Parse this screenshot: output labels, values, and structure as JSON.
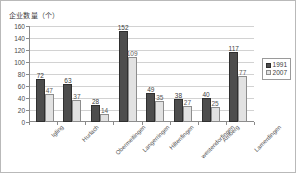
{
  "chart_data": {
    "type": "bar",
    "title": "",
    "ylabel": "企业数量（个）",
    "xlabel": "",
    "ylim": [
      0,
      160
    ],
    "ytick_values": [
      0,
      20,
      40,
      60,
      80,
      100,
      120,
      140,
      160
    ],
    "grid": true,
    "legend_position": "right",
    "categories": [
      "Igling",
      "Hurlach",
      "Obermeitingen",
      "Langerringen",
      "Hiltenfingen",
      "westendorfingen",
      "Amberg",
      "Lamerdingen"
    ],
    "series": [
      {
        "name": "1991",
        "color": "#4d4d4d",
        "values": [
          72,
          63,
          28,
          152,
          49,
          38,
          40,
          117
        ]
      },
      {
        "name": "2007",
        "color": "#e2e2e2",
        "values": [
          47,
          37,
          14,
          109,
          35,
          27,
          25,
          77
        ]
      }
    ]
  }
}
